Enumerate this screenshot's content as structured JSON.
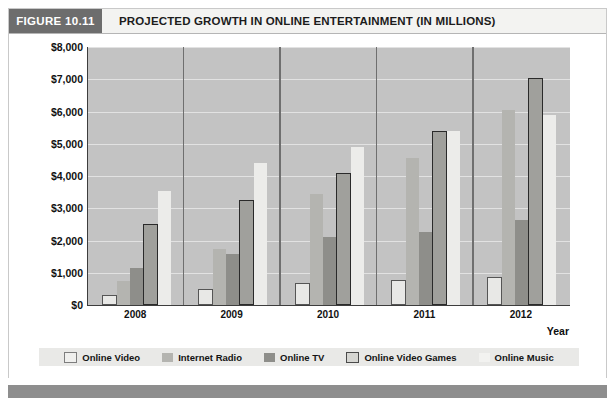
{
  "figure": {
    "tag": "FIGURE 10.11",
    "title": "PROJECTED GROWTH IN ONLINE ENTERTAINMENT (IN MILLIONS)"
  },
  "chart_data": {
    "type": "bar",
    "title": "PROJECTED GROWTH IN ONLINE ENTERTAINMENT (IN MILLIONS)",
    "xlabel": "Year",
    "ylabel": "",
    "ylim": [
      0,
      8000
    ],
    "ytick_labels": [
      "$8,000",
      "$7,000",
      "$6,000",
      "$5,000",
      "$4,000",
      "$3,000",
      "$2,000",
      "$1,000",
      "$0"
    ],
    "ytick_values": [
      8000,
      7000,
      6000,
      5000,
      4000,
      3000,
      2000,
      1000,
      0
    ],
    "grid": true,
    "legend_position": "bottom",
    "categories": [
      "2008",
      "2009",
      "2010",
      "2011",
      "2012"
    ],
    "series": [
      {
        "name": "Online Video",
        "color": "#efefed",
        "values": [
          250,
          430,
          620,
          720,
          800
        ]
      },
      {
        "name": "Internet Radio",
        "color": "#b4b4b0",
        "values": [
          750,
          1750,
          3450,
          4550,
          6050
        ]
      },
      {
        "name": "Online TV",
        "color": "#8e8e8a",
        "values": [
          1150,
          1580,
          2120,
          2270,
          2650
        ]
      },
      {
        "name": "Online Video Games",
        "color": "#a0a09c",
        "values": [
          2450,
          3200,
          4030,
          5320,
          6970
        ]
      },
      {
        "name": "Online Music",
        "color": "#f2f2f0",
        "values": [
          3550,
          4400,
          4900,
          5400,
          5900
        ]
      }
    ]
  },
  "legend": {
    "items": [
      {
        "label": "Online Video"
      },
      {
        "label": "Internet Radio"
      },
      {
        "label": "Online TV"
      },
      {
        "label": "Online Video Games"
      },
      {
        "label": "Online Music"
      }
    ]
  }
}
